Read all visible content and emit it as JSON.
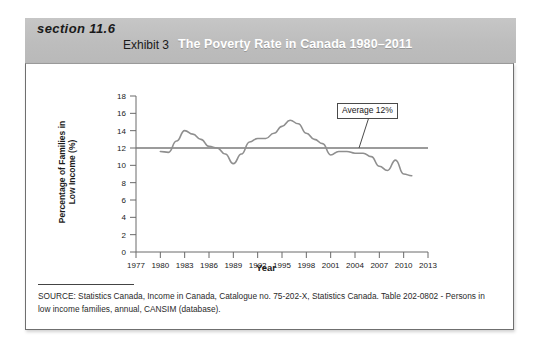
{
  "header": {
    "section_label": "section 11.6",
    "exhibit_label": "Exhibit 3",
    "title": "The Poverty Rate in Canada 1980–2011",
    "band_color": "#c2c2c2",
    "title_color": "#ffffff"
  },
  "source": {
    "text": "SOURCE: Statistics Canada, Income in Canada, Catalogue no. 75-202-X,  Statistics Canada. Table 202-0802 - Persons in low income families, annual, CANSIM (database)."
  },
  "annotation": {
    "average_label": "Average 12%"
  },
  "chart_data": {
    "type": "line",
    "title": "The Poverty Rate in Canada 1980–2011",
    "xlabel": "Year",
    "ylabel": "Percentage of Families in\nLow Income (%)",
    "xlim": [
      1977,
      2013
    ],
    "ylim": [
      0,
      18
    ],
    "ytick_step": 2,
    "yticks": [
      0,
      2,
      4,
      6,
      8,
      10,
      12,
      14,
      16,
      18
    ],
    "xticks": [
      1977,
      1980,
      1983,
      1986,
      1989,
      1992,
      1995,
      1998,
      2001,
      2004,
      2007,
      2010,
      2013
    ],
    "grid": false,
    "legend": false,
    "line_color": "#8f8f8f",
    "reference_line": {
      "label": "Average 12%",
      "value": 12,
      "color": "#7a7a7a",
      "x_start": 1977,
      "x_end": 2013
    },
    "series": [
      {
        "name": "Percentage of families in low income",
        "x": [
          1980,
          1981,
          1982,
          1983,
          1984,
          1985,
          1986,
          1987,
          1988,
          1989,
          1990,
          1991,
          1992,
          1993,
          1994,
          1995,
          1996,
          1997,
          1998,
          1999,
          2000,
          2001,
          2002,
          2003,
          2004,
          2005,
          2006,
          2007,
          2008,
          2009,
          2010,
          2011
        ],
        "values": [
          11.6,
          11.5,
          12.8,
          14.0,
          13.6,
          13.0,
          12.2,
          12.0,
          11.3,
          10.2,
          11.3,
          12.7,
          13.1,
          13.1,
          13.7,
          14.5,
          15.2,
          14.8,
          13.7,
          13.0,
          12.5,
          11.2,
          11.6,
          11.6,
          11.4,
          11.4,
          11.0,
          9.9,
          9.4,
          10.6,
          9.0,
          8.8
        ],
        "color": "#8f8f8f"
      }
    ]
  }
}
